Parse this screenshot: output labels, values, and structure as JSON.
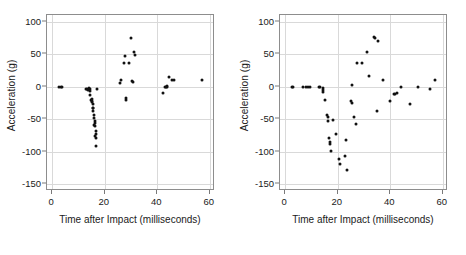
{
  "figure": {
    "background": "#ffffff",
    "point_color": "#111111",
    "grid_color": "#d9d9d9",
    "frame_color": "#8d8d8d"
  },
  "chart_data": [
    {
      "type": "scatter",
      "panel": "left",
      "title": "",
      "xlabel": "Time after Impact (milliseconds)",
      "ylabel": "Acceleration (g)",
      "xlim": [
        -2,
        62
      ],
      "ylim": [
        -160,
        110
      ],
      "xticks": [
        0,
        20,
        40,
        60
      ],
      "yticks": [
        100,
        50,
        0,
        -50,
        -100,
        -150
      ],
      "grid": true,
      "legend": "none",
      "points": [
        [
          2.6,
          -1
        ],
        [
          3.2,
          -1
        ],
        [
          3.7,
          -1
        ],
        [
          12.8,
          -3
        ],
        [
          13.3,
          -3
        ],
        [
          13.6,
          -5
        ],
        [
          13.9,
          -2
        ],
        [
          14.2,
          -3
        ],
        [
          14.5,
          -6
        ],
        [
          14.3,
          -12
        ],
        [
          14.6,
          -21
        ],
        [
          15.0,
          -24
        ],
        [
          15.2,
          -22
        ],
        [
          15.3,
          -19
        ],
        [
          15.5,
          -26
        ],
        [
          15.4,
          -33
        ],
        [
          15.7,
          -32
        ],
        [
          15.6,
          -38
        ],
        [
          15.9,
          -44
        ],
        [
          16.0,
          -48
        ],
        [
          16.1,
          -53
        ],
        [
          16.2,
          -55
        ],
        [
          16.0,
          -58
        ],
        [
          16.3,
          -60
        ],
        [
          16.5,
          -68
        ],
        [
          16.6,
          -72
        ],
        [
          16.4,
          -75
        ],
        [
          16.7,
          -78
        ],
        [
          16.6,
          -91
        ],
        [
          17.0,
          -4
        ],
        [
          25.9,
          5
        ],
        [
          26.3,
          10
        ],
        [
          27.3,
          37
        ],
        [
          27.6,
          47
        ],
        [
          28.0,
          -20
        ],
        [
          28.2,
          -17
        ],
        [
          29.1,
          36
        ],
        [
          30.0,
          75
        ],
        [
          30.4,
          8
        ],
        [
          30.6,
          7
        ],
        [
          31.2,
          54
        ],
        [
          31.5,
          49
        ],
        [
          42.3,
          -10
        ],
        [
          42.9,
          0
        ],
        [
          43.3,
          -1
        ],
        [
          43.6,
          0
        ],
        [
          43.9,
          1
        ],
        [
          44.4,
          15
        ],
        [
          45.6,
          11
        ],
        [
          46.3,
          11
        ],
        [
          56.9,
          11
        ]
      ]
    },
    {
      "type": "scatter",
      "panel": "right",
      "title": "",
      "xlabel": "Time after Impact (milliseconds)",
      "ylabel": "Acceleration (g)",
      "xlim": [
        -2,
        62
      ],
      "ylim": [
        -160,
        110
      ],
      "xticks": [
        0,
        20,
        40,
        60
      ],
      "yticks": [
        100,
        50,
        0,
        -50,
        -100,
        -150
      ],
      "grid": true,
      "legend": "none",
      "points": [
        [
          2.6,
          0
        ],
        [
          3.1,
          0
        ],
        [
          6.9,
          -1
        ],
        [
          7.8,
          -1
        ],
        [
          8.6,
          -1
        ],
        [
          9.4,
          -1
        ],
        [
          12.8,
          -1
        ],
        [
          13.4,
          -1
        ],
        [
          14.2,
          -2
        ],
        [
          14.3,
          -5
        ],
        [
          14.4,
          -8
        ],
        [
          15.2,
          -21
        ],
        [
          15.9,
          -43
        ],
        [
          16.1,
          -47
        ],
        [
          16.3,
          -52
        ],
        [
          16.6,
          -79
        ],
        [
          16.9,
          -88
        ],
        [
          17.1,
          -85
        ],
        [
          17.6,
          -99
        ],
        [
          18.3,
          -51
        ],
        [
          19.2,
          -73
        ],
        [
          20.4,
          -111
        ],
        [
          21.0,
          -118
        ],
        [
          22.6,
          -107
        ],
        [
          23.3,
          -81
        ],
        [
          23.6,
          -128
        ],
        [
          25.0,
          -22
        ],
        [
          25.3,
          -25
        ],
        [
          25.6,
          3
        ],
        [
          26.0,
          -46
        ],
        [
          26.8,
          -57
        ],
        [
          27.2,
          37
        ],
        [
          29.1,
          36
        ],
        [
          31.0,
          54
        ],
        [
          32.0,
          16
        ],
        [
          33.9,
          77
        ],
        [
          34.3,
          75
        ],
        [
          34.8,
          -37
        ],
        [
          35.2,
          70
        ],
        [
          37.3,
          11
        ],
        [
          39.8,
          -22
        ],
        [
          41.3,
          -11
        ],
        [
          41.8,
          -11
        ],
        [
          42.6,
          -10
        ],
        [
          44.0,
          0
        ],
        [
          47.5,
          -27
        ],
        [
          50.7,
          0
        ],
        [
          55.2,
          -3
        ],
        [
          56.9,
          10
        ]
      ]
    }
  ]
}
